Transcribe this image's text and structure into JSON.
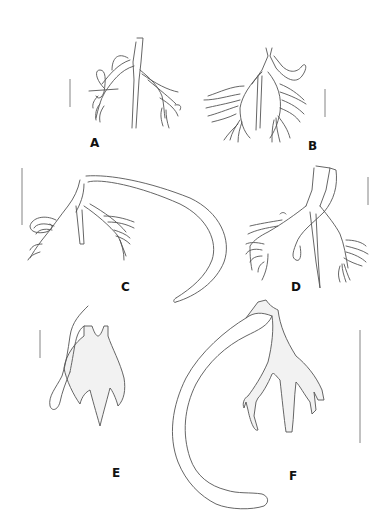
{
  "figure": {
    "panels": [
      {
        "id": "A",
        "label": "A",
        "scale_bar": true
      },
      {
        "id": "B",
        "label": "B",
        "scale_bar": true
      },
      {
        "id": "C",
        "label": "C",
        "scale_bar": true
      },
      {
        "id": "D",
        "label": "D",
        "scale_bar": true
      },
      {
        "id": "E",
        "label": "E",
        "scale_bar": true
      },
      {
        "id": "F",
        "label": "F",
        "scale_bar": true
      }
    ],
    "colors": {
      "background": "#ffffff",
      "line": "#555555",
      "shading": "#f2f2f2",
      "label": "#111111"
    }
  }
}
